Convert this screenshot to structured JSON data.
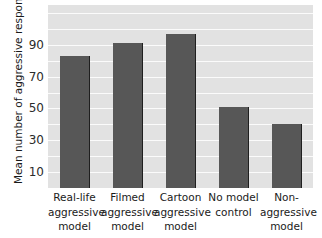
{
  "chart_data": {
    "type": "bar",
    "title": "",
    "xlabel": "",
    "ylabel": "Mean number of aggressive responses",
    "categories": [
      "Real-life aggressive model",
      "Filmed aggressive model",
      "Cartoon aggressive model",
      "No model control",
      "Non-aggressive model"
    ],
    "category_lines": [
      [
        "Real-life",
        "aggressive",
        "model"
      ],
      [
        "Filmed",
        "aggressive",
        "model"
      ],
      [
        "Cartoon",
        "aggressive",
        "model"
      ],
      [
        "No model",
        "control"
      ],
      [
        "Non-",
        "aggressive",
        "model"
      ]
    ],
    "values": [
      83,
      91,
      97,
      51,
      40
    ],
    "ylim": [
      0,
      115
    ],
    "yticks": [
      10,
      30,
      50,
      70,
      90
    ],
    "ytick_labels": [
      "10",
      "30",
      "50",
      "70",
      "90"
    ],
    "gridlines_every": 10,
    "grid": true,
    "legend": "none",
    "colors": {
      "bar": "#575757",
      "bar_edge": "#1f1f1f",
      "plot_background": "#e2e2e2",
      "gridline": "#fbfbfb",
      "figure_background": "#ffffff",
      "text": "#1a1a1a"
    }
  }
}
